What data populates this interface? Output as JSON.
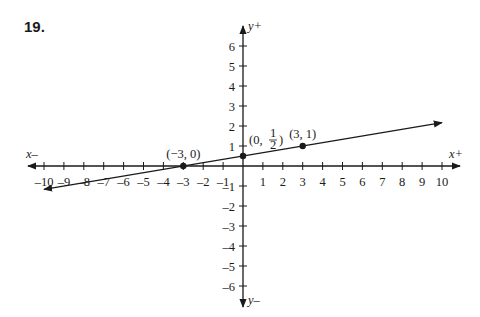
{
  "problem": {
    "number": "19."
  },
  "chart_data": {
    "type": "line",
    "title": "",
    "xlabel": "",
    "ylabel": "",
    "axis_labels": {
      "x_pos": "x+",
      "x_neg": "x–",
      "y_pos": "y+",
      "y_neg": "y–"
    },
    "xlim": [
      -10,
      10
    ],
    "ylim": [
      -6,
      6
    ],
    "x_ticks": [
      -10,
      -9,
      -8,
      -7,
      -6,
      -5,
      -4,
      -3,
      -2,
      -1,
      1,
      2,
      3,
      4,
      5,
      6,
      7,
      8,
      9,
      10
    ],
    "y_ticks": [
      -6,
      -5,
      -4,
      -3,
      -2,
      -1,
      1,
      2,
      3,
      4,
      5,
      6
    ],
    "grid": false,
    "series": [
      {
        "name": "line",
        "equation": "y = x/6 + 1/2",
        "x": [
          -10,
          10
        ],
        "y": [
          -1.1667,
          2.1667
        ],
        "arrows": "both"
      }
    ],
    "points": [
      {
        "x": -3,
        "y": 0,
        "label": "(−3, 0)"
      },
      {
        "x": 0,
        "y": 0.5,
        "label": "(0, 1/2)"
      },
      {
        "x": 3,
        "y": 1,
        "label": "(3, 1)"
      }
    ]
  }
}
